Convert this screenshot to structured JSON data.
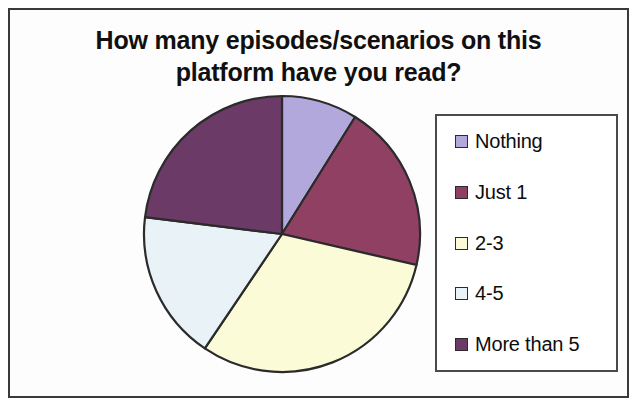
{
  "chart_data": {
    "type": "pie",
    "title": "How many episodes/scenarios on this platform have you read?",
    "title_lines": [
      "How many episodes/scenarios on this",
      "platform have you read?"
    ],
    "categories": [
      "Nothing",
      "Just 1",
      "2-3",
      "4-5",
      "More than 5"
    ],
    "values": [
      9,
      20,
      31,
      17,
      23
    ],
    "unit": "percent",
    "start_angle_deg": 0,
    "direction": "clockwise",
    "slice_angles_deg": [
      32,
      71,
      111,
      63,
      83
    ],
    "colors": [
      "#b3a8dc",
      "#904063",
      "#fcfbd8",
      "#e9f3f7",
      "#6b3a66"
    ],
    "slice_border_color": "#2b2b2b",
    "legend_position": "right",
    "grid": false,
    "xlabel": "",
    "ylabel": "",
    "series": [
      {
        "name": "Responses",
        "points": [
          {
            "label": "Nothing",
            "value": 9,
            "color": "#b3a8dc"
          },
          {
            "label": "Just 1",
            "value": 20,
            "color": "#904063"
          },
          {
            "label": "2-3",
            "value": 31,
            "color": "#fcfbd8"
          },
          {
            "label": "4-5",
            "value": 17,
            "color": "#e9f3f7"
          },
          {
            "label": "More than 5",
            "value": 23,
            "color": "#6b3a66"
          }
        ]
      }
    ]
  },
  "legend": {
    "items": [
      {
        "label": "Nothing",
        "color": "#b3a8dc"
      },
      {
        "label": "Just 1",
        "color": "#904063"
      },
      {
        "label": "2-3",
        "color": "#fcfbd8"
      },
      {
        "label": "4-5",
        "color": "#e9f3f7"
      },
      {
        "label": "More than 5",
        "color": "#6b3a66"
      }
    ]
  }
}
